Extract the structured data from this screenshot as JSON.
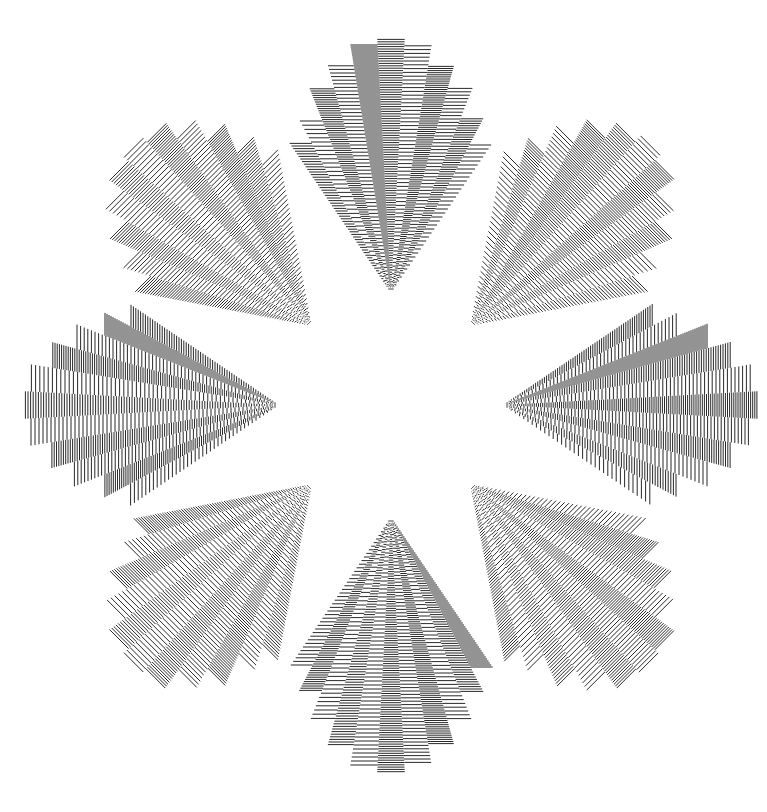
{
  "artwork": {
    "title": "Radial op-art fan rosette",
    "description": "Eight fans of striped wedges arranged around an empty star-shaped centre",
    "background": "#ffffff",
    "ink": "#111111"
  },
  "geometry": {
    "canvas": [
      767,
      812
    ],
    "center": [
      391,
      405
    ],
    "fan_count": 8,
    "apex_radius": 112,
    "first_fan_angle_deg": -90,
    "wedges_per_fan": 11,
    "wedge_angle_deg": 6.2,
    "wedge_lengths": [
      150,
      175,
      205,
      228,
      248,
      255,
      248,
      228,
      205,
      175,
      150
    ],
    "spacing_pattern": [
      2.6,
      4.2,
      2.2,
      3.6,
      2.0,
      2.4,
      3.8,
      2.1,
      3.4,
      2.3,
      4.0
    ],
    "line_width": 0.9
  }
}
